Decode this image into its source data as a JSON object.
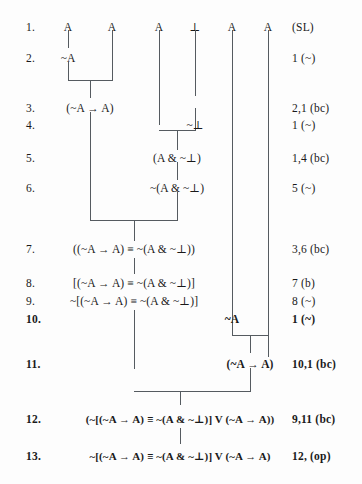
{
  "diagram": {
    "type": "proof-tree",
    "columns_top": [
      "A",
      "A",
      "A",
      "⊥",
      "A",
      "A"
    ],
    "top_justification": "(SL)",
    "lines": [
      {
        "n": "1.",
        "formula": "",
        "just": "(SL)",
        "bold": false
      },
      {
        "n": "2.",
        "formula": "~A",
        "just": "1 (~)",
        "bold": false
      },
      {
        "n": "3.",
        "formula": "(~A → A)",
        "just": "2,1 (bc)",
        "bold": false
      },
      {
        "n": "4.",
        "formula": "~⊥",
        "just": "1 (~)",
        "bold": false
      },
      {
        "n": "5.",
        "formula": "(A & ~⊥)",
        "just": "1,4 (bc)",
        "bold": false
      },
      {
        "n": "6.",
        "formula": "~(A & ~⊥)",
        "just": "5 (~)",
        "bold": false
      },
      {
        "n": "7.",
        "formula": "((~A → A) ≡ ~(A & ~⊥))",
        "just": "3,6 (bc)",
        "bold": false
      },
      {
        "n": "8.",
        "formula": "[(~A → A) ≡ ~(A & ~⊥)]",
        "just": "7 (b)",
        "bold": false
      },
      {
        "n": "9.",
        "formula": "~[(~A → A) ≡ ~(A & ~⊥)]",
        "just": "8 (~)",
        "bold": false
      },
      {
        "n": "10.",
        "formula": "~A",
        "just": "1 (~)",
        "bold": true
      },
      {
        "n": "11.",
        "formula": "(~A → A)",
        "just": "10,1 (bc)",
        "bold": true
      },
      {
        "n": "12.",
        "formula": "(~[(~A → A) ≡ ~(A & ~⊥)] V (~A → A))",
        "just": "9,11 (bc)",
        "bold": true
      },
      {
        "n": "13.",
        "formula": "~[(~A → A) ≡ ~(A & ~⊥)] V (~A → A)",
        "just": "12, (op)",
        "bold": true
      }
    ]
  }
}
